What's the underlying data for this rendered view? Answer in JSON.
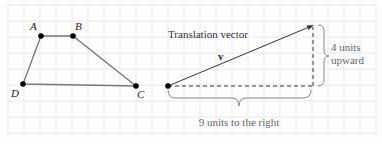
{
  "figure": {
    "grid": {
      "spacing": 16,
      "x0": 8,
      "y0": 5,
      "x1": 376,
      "y1": 137,
      "color": "#e3e3e3"
    },
    "quadrilateral": {
      "stroke": "#7a7a7a",
      "vertices": [
        {
          "label": "A",
          "x": 41,
          "y": 36,
          "lx": 30,
          "ly": 30
        },
        {
          "label": "B",
          "x": 73,
          "y": 36,
          "lx": 75,
          "ly": 30
        },
        {
          "label": "C",
          "x": 136,
          "y": 86,
          "lx": 137,
          "ly": 98
        },
        {
          "label": "D",
          "x": 23,
          "y": 84,
          "lx": 11,
          "ly": 97
        }
      ]
    },
    "vector": {
      "title": "Translation vector",
      "name": "v",
      "start": {
        "x": 168,
        "y": 86
      },
      "end": {
        "x": 314,
        "y": 25
      },
      "color": "#333333"
    },
    "horizontal_component": {
      "label": "9 units to the right",
      "units": 9
    },
    "vertical_component": {
      "label_line1": "4 units",
      "label_line2": "upward",
      "units": 4
    },
    "label_color": "#666666"
  }
}
